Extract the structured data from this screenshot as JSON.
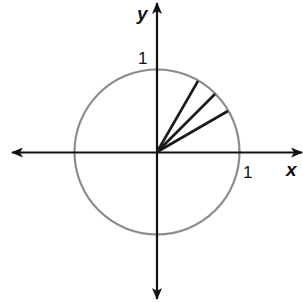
{
  "diagram": {
    "type": "unit-circle",
    "axes": {
      "x_label": "x",
      "y_label": "y",
      "x_tick_label": "1",
      "y_tick_label": "1"
    },
    "circle": {
      "radius_units": 1,
      "stroke_color": "#8c8c8c"
    },
    "rays": [
      {
        "angle_deg": 30
      },
      {
        "angle_deg": 45
      },
      {
        "angle_deg": 60
      }
    ],
    "colors": {
      "axis": "#111111",
      "ray": "#1a1a1a",
      "circle": "#8c8c8c"
    }
  }
}
